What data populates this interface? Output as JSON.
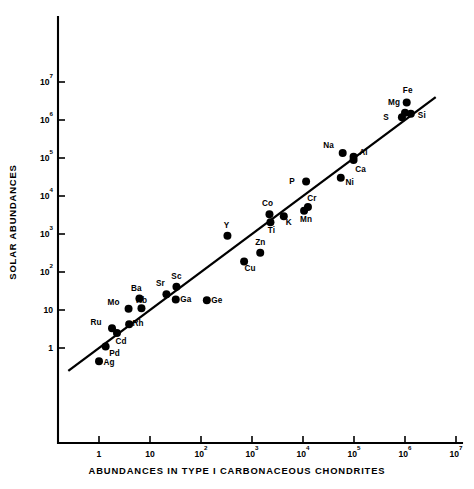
{
  "chart_data": {
    "type": "scatter",
    "title": "",
    "xlabel": "ABUNDANCES IN TYPE I CARBONACEOUS CHONDRITES",
    "ylabel": "SOLAR ABUNDANCES",
    "xscale": "log",
    "yscale": "log",
    "xlim": [
      0.2,
      10000000
    ],
    "ylim": [
      0.25,
      10000000
    ],
    "grid": false,
    "legend": null,
    "xticks": [
      {
        "value": 1,
        "label": "1",
        "mantissa": "1",
        "exponent": ""
      },
      {
        "value": 10,
        "label": "10",
        "mantissa": "10",
        "exponent": ""
      },
      {
        "value": 100,
        "label": "10^2",
        "mantissa": "10",
        "exponent": "2"
      },
      {
        "value": 1000,
        "label": "10^3",
        "mantissa": "10",
        "exponent": "3"
      },
      {
        "value": 10000,
        "label": "10^4",
        "mantissa": "10",
        "exponent": "4"
      },
      {
        "value": 100000,
        "label": "10^5",
        "mantissa": "10",
        "exponent": "5"
      },
      {
        "value": 1000000,
        "label": "10^6",
        "mantissa": "10",
        "exponent": "6"
      },
      {
        "value": 10000000,
        "label": "10^7",
        "mantissa": "10",
        "exponent": "7"
      }
    ],
    "yticks": [
      {
        "value": 1,
        "label": "1",
        "mantissa": "1",
        "exponent": ""
      },
      {
        "value": 10,
        "label": "10",
        "mantissa": "10",
        "exponent": ""
      },
      {
        "value": 100,
        "label": "10^2",
        "mantissa": "10",
        "exponent": "2"
      },
      {
        "value": 1000,
        "label": "10^3",
        "mantissa": "10",
        "exponent": "3"
      },
      {
        "value": 10000,
        "label": "10^4",
        "mantissa": "10",
        "exponent": "4"
      },
      {
        "value": 100000,
        "label": "10^5",
        "mantissa": "10",
        "exponent": "5"
      },
      {
        "value": 1000000,
        "label": "10^6",
        "mantissa": "10",
        "exponent": "6"
      },
      {
        "value": 10000000,
        "label": "10^7",
        "mantissa": "10",
        "exponent": "7"
      }
    ],
    "trendline": {
      "kind": "one-to-one",
      "x": [
        0.25,
        4000000
      ],
      "y": [
        0.25,
        4000000
      ],
      "annotation": ""
    },
    "points": [
      {
        "label": "Ag",
        "x": 1.0,
        "y": 0.45,
        "lx": 10,
        "ly": 4
      },
      {
        "label": "Pd",
        "x": 1.35,
        "y": 1.1,
        "lx": 9,
        "ly": 10
      },
      {
        "label": "Cd",
        "x": 2.25,
        "y": 2.5,
        "lx": 4,
        "ly": 11
      },
      {
        "label": "Ru",
        "x": 1.8,
        "y": 3.3,
        "lx": -16,
        "ly": -3
      },
      {
        "label": "Rh",
        "x": 3.9,
        "y": 4.2,
        "lx": 9,
        "ly": 2
      },
      {
        "label": "Mo",
        "x": 3.8,
        "y": 10.8,
        "lx": -15,
        "ly": -4
      },
      {
        "label": "Rb",
        "x": 6.8,
        "y": 11.2,
        "lx": 0,
        "ly": -5
      },
      {
        "label": "Ba",
        "x": 6.2,
        "y": 20,
        "lx": -3,
        "ly": -8
      },
      {
        "label": "Sr",
        "x": 21,
        "y": 26,
        "lx": -6,
        "ly": -8
      },
      {
        "label": "Sc",
        "x": 33,
        "y": 41,
        "lx": 0,
        "ly": -8
      },
      {
        "label": "Ga",
        "x": 32,
        "y": 19,
        "lx": 10,
        "ly": 3
      },
      {
        "label": "Ge",
        "x": 130,
        "y": 18,
        "lx": 10,
        "ly": 3
      },
      {
        "label": "Cu",
        "x": 700,
        "y": 190,
        "lx": 6,
        "ly": 10
      },
      {
        "label": "Zn",
        "x": 1450,
        "y": 320,
        "lx": 0,
        "ly": -8
      },
      {
        "label": "Y",
        "x": 330,
        "y": 900,
        "lx": -1,
        "ly": -8
      },
      {
        "label": "Ti",
        "x": 2300,
        "y": 2050,
        "lx": 1,
        "ly": 11
      },
      {
        "label": "Co",
        "x": 2200,
        "y": 3300,
        "lx": -2,
        "ly": -8
      },
      {
        "label": "K",
        "x": 4200,
        "y": 2950,
        "lx": 5,
        "ly": 9
      },
      {
        "label": "Mn",
        "x": 10500,
        "y": 4100,
        "lx": 2,
        "ly": 11
      },
      {
        "label": "Cr",
        "x": 12500,
        "y": 5100,
        "lx": 4,
        "ly": -6
      },
      {
        "label": "P",
        "x": 11500,
        "y": 24000,
        "lx": -14,
        "ly": 2
      },
      {
        "label": "Ni",
        "x": 55000,
        "y": 30000,
        "lx": 9,
        "ly": 7
      },
      {
        "label": "Na",
        "x": 60000,
        "y": 135000,
        "lx": -14,
        "ly": -5
      },
      {
        "label": "Al",
        "x": 98000,
        "y": 108000,
        "lx": 10,
        "ly": -2
      },
      {
        "label": "Ca",
        "x": 98000,
        "y": 88000,
        "lx": 7,
        "ly": 12
      },
      {
        "label": "S",
        "x": 870000,
        "y": 1180000,
        "lx": -16,
        "ly": 3
      },
      {
        "label": "Si",
        "x": 1300000,
        "y": 1450000,
        "lx": 11,
        "ly": 4
      },
      {
        "label": "Mg",
        "x": 1000000,
        "y": 1550000,
        "lx": -11,
        "ly": -8
      },
      {
        "label": "Fe",
        "x": 1080000,
        "y": 2900000,
        "lx": 1,
        "ly": -9
      }
    ]
  }
}
